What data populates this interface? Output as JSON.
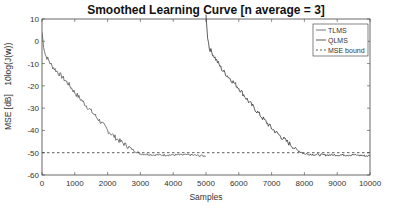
{
  "chart_data": {
    "type": "line",
    "title": "Smoothed Learning Curve [n average = 3]",
    "xlabel": "Samples",
    "ylabel_left": "MSE [dB]",
    "ylabel_right": "10log(J(w))",
    "xlim": [
      0,
      10000
    ],
    "ylim": [
      -60,
      10
    ],
    "xticks": [
      0,
      1000,
      2000,
      3000,
      4000,
      5000,
      6000,
      7000,
      8000,
      9000,
      10000
    ],
    "yticks": [
      10,
      0,
      -10,
      -20,
      -30,
      -40,
      -50,
      -60
    ],
    "grid": false,
    "legend_position": "top-right",
    "series": [
      {
        "name": "TLMS",
        "style": "solid",
        "color": "#555555",
        "x": [
          0,
          50,
          100,
          300,
          550,
          800,
          1000,
          1300,
          1600,
          1900,
          2000,
          2300,
          2600,
          2800,
          3000,
          3500,
          4000,
          4500,
          4990
        ],
        "y": [
          4,
          -2,
          -6,
          -11,
          -15,
          -19,
          -23,
          -28,
          -33,
          -38,
          -40,
          -44,
          -47,
          -49,
          -50.5,
          -51,
          -51,
          -51,
          -51.5
        ]
      },
      {
        "name": "QLMS",
        "style": "solid",
        "color": "#333333",
        "x": [
          5000,
          5005,
          5050,
          5100,
          5300,
          5500,
          6000,
          6300,
          6700,
          7000,
          7300,
          7550,
          7800,
          8000,
          8500,
          9000,
          9500,
          10000
        ],
        "y": [
          12,
          10,
          2,
          -3,
          -8,
          -13,
          -21,
          -27,
          -34,
          -39,
          -43,
          -46,
          -49,
          -50.5,
          -51,
          -51,
          -51,
          -51.5
        ]
      },
      {
        "name": "MSE bound",
        "style": "dashed",
        "color": "#333333",
        "x": [
          0,
          10000
        ],
        "y": [
          -50,
          -50
        ]
      }
    ]
  },
  "legend": {
    "items": [
      {
        "label": "TLMS",
        "style": "solid"
      },
      {
        "label": "QLMS",
        "style": "solid"
      },
      {
        "label": "MSE bound",
        "style": "dashed"
      }
    ]
  }
}
